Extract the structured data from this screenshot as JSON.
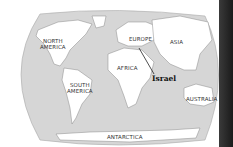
{
  "map": {
    "title": "World map highlighting Israel",
    "ocean_color": "#d6d6d6",
    "land_color": "#ffffff",
    "highlight": "Israel",
    "labels": {
      "north_america_1": "NORTH",
      "north_america_2": "AMERICA",
      "south_america_1": "SOUTH",
      "south_america_2": "AMERICA",
      "europe": "EUROPE",
      "asia": "ASIA",
      "africa": "AFRICA",
      "australia": "AUSTRALIA",
      "antarctica": "ANTARCTICA",
      "israel": "Israel"
    }
  }
}
